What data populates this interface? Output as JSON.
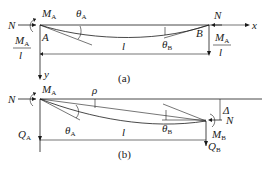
{
  "figure_a": {
    "caption": "(a)",
    "axial_force_left": "N",
    "axial_force_right": "N",
    "moment_A": {
      "symbol": "M",
      "sub": "A"
    },
    "theta_A": {
      "symbol": "θ",
      "sub": "A"
    },
    "theta_B": {
      "symbol": "θ",
      "sub": "B"
    },
    "point_A": "A",
    "point_B": "B",
    "length": "l",
    "axis_x": "x",
    "axis_y": "y",
    "reaction_left": {
      "num_symbol": "M",
      "num_sub": "A",
      "den": "l"
    },
    "reaction_right": {
      "num_symbol": "M",
      "num_sub": "A",
      "den": "l"
    }
  },
  "figure_b": {
    "caption": "(b)",
    "axial_force_left": "N",
    "axial_force_right": "N",
    "moment_A": {
      "symbol": "M",
      "sub": "A"
    },
    "moment_B": {
      "symbol": "M",
      "sub": "B"
    },
    "rho": "ρ",
    "theta_A": {
      "symbol": "θ",
      "sub": "A"
    },
    "theta_B": {
      "symbol": "θ",
      "sub": "B"
    },
    "shear_A": {
      "symbol": "Q",
      "sub": "A"
    },
    "shear_B": {
      "symbol": "Q",
      "sub": "B"
    },
    "delta": "Δ",
    "length": "l"
  }
}
